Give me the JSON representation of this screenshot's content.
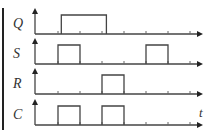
{
  "diagram": {
    "type": "timing-diagram",
    "time_axis_label": "t",
    "tick_count": 7,
    "signals": [
      {
        "name": "Q",
        "pulses": [
          [
            1.15,
            3.2
          ]
        ]
      },
      {
        "name": "S",
        "pulses": [
          [
            1,
            2
          ],
          [
            5,
            6
          ]
        ]
      },
      {
        "name": "R",
        "pulses": [
          [
            3,
            4
          ]
        ]
      },
      {
        "name": "C",
        "pulses": [
          [
            1,
            2
          ],
          [
            3,
            4
          ]
        ]
      }
    ],
    "colors": {
      "line": "#444444",
      "text": "#333333",
      "border_bar": "#222222"
    }
  }
}
